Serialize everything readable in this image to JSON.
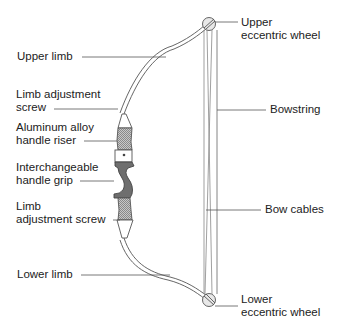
{
  "diagram": {
    "labels_left": [
      {
        "id": "upper-limb",
        "lines": [
          "Upper limb"
        ]
      },
      {
        "id": "upper-limb-adjustment-screw",
        "lines": [
          "Limb adjustment",
          "screw"
        ]
      },
      {
        "id": "handle-riser",
        "lines": [
          "Aluminum alloy",
          "handle riser"
        ]
      },
      {
        "id": "handle-grip",
        "lines": [
          "Interchangeable",
          "handle grip"
        ]
      },
      {
        "id": "lower-limb-adjustment-screw",
        "lines": [
          "Limb",
          "adjustment screw"
        ]
      },
      {
        "id": "lower-limb",
        "lines": [
          "Lower limb"
        ]
      }
    ],
    "labels_right": [
      {
        "id": "upper-eccentric-wheel",
        "lines": [
          "Upper",
          "eccentric wheel"
        ]
      },
      {
        "id": "bowstring",
        "lines": [
          "Bowstring"
        ]
      },
      {
        "id": "bow-cables",
        "lines": [
          "Bow cables"
        ]
      },
      {
        "id": "lower-eccentric-wheel",
        "lines": [
          "Lower",
          "eccentric wheel"
        ]
      }
    ],
    "colors": {
      "line": "#555555",
      "grip": "#6e6e6e",
      "riser_hatch": "#9a9a9a",
      "background": "#ffffff"
    }
  }
}
